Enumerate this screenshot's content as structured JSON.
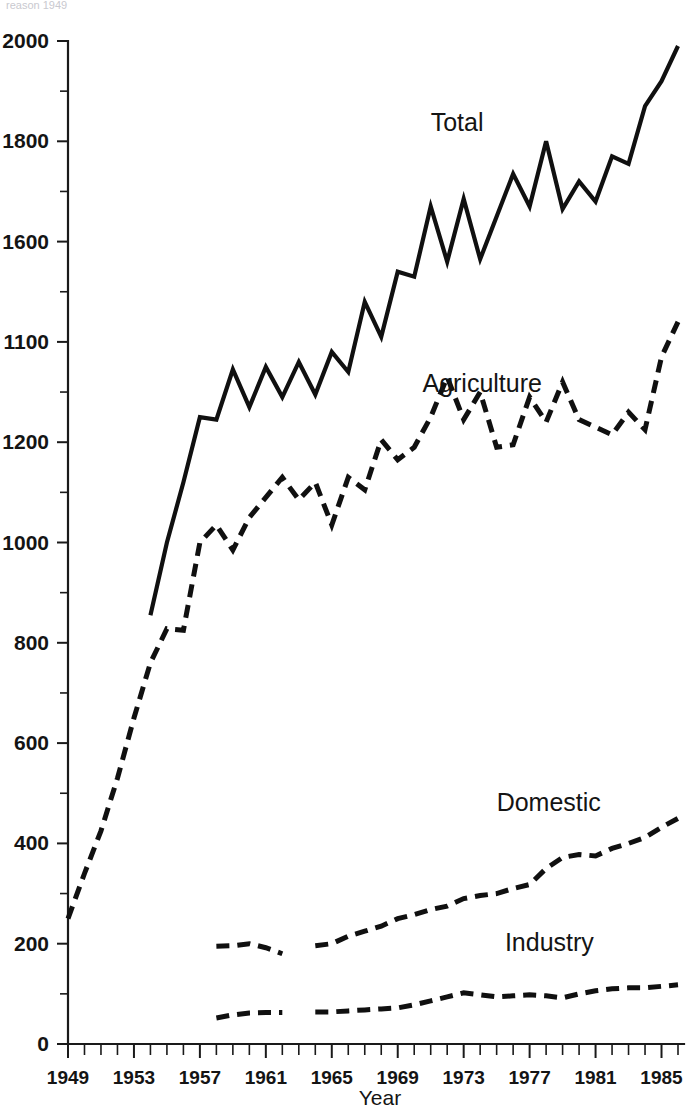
{
  "figure": {
    "top_fragment": "reason 1949",
    "background_color": "#ffffff",
    "ink_color": "#101010"
  },
  "labels": {
    "total": "Total",
    "agriculture": "Agriculture",
    "domestic": "Domestic",
    "industry": "Industry",
    "xaxis_title": "Year"
  },
  "chart_data": {
    "type": "line",
    "title": "",
    "subtitle": "",
    "xlabel": "Year",
    "ylabel": "",
    "xlim": [
      1949,
      1986
    ],
    "ylim": [
      0,
      2000
    ],
    "grid": false,
    "legend_position": "inline-annotations",
    "y_ticks_major": [
      0,
      200,
      400,
      600,
      800,
      1000,
      1200,
      1100,
      1600,
      1800,
      2000
    ],
    "y_tick_labels": [
      "0",
      "200",
      "400",
      "600",
      "800",
      "1000",
      "1200",
      "1100",
      "1600",
      "1800",
      "2000"
    ],
    "y_tick_values": [
      0,
      200,
      400,
      600,
      800,
      1000,
      1200,
      1400,
      1600,
      1800,
      2000
    ],
    "y_minor_tick_values": [
      100,
      300,
      500,
      700,
      900,
      1100,
      1300,
      1500,
      1700,
      1900
    ],
    "x_tick_labels": [
      "1949",
      "1953",
      "1957",
      "1961",
      "1965",
      "1969",
      "1973",
      "1977",
      "1981",
      "1985"
    ],
    "x_tick_values": [
      1949,
      1953,
      1957,
      1961,
      1965,
      1969,
      1973,
      1977,
      1981,
      1985
    ],
    "x_minor_tick_step": 1,
    "series": [
      {
        "name": "Total",
        "style": "solid",
        "x": [
          1954,
          1955,
          1956,
          1957,
          1958,
          1959,
          1960,
          1961,
          1962,
          1963,
          1964,
          1965,
          1966,
          1967,
          1968,
          1969,
          1970,
          1971,
          1972,
          1973,
          1974,
          1975,
          1976,
          1977,
          1978,
          1979,
          1980,
          1981,
          1982,
          1983,
          1984,
          1985,
          1986
        ],
        "values": [
          855,
          1000,
          1120,
          1250,
          1245,
          1345,
          1270,
          1350,
          1290,
          1360,
          1295,
          1380,
          1340,
          1480,
          1410,
          1540,
          1530,
          1670,
          1560,
          1685,
          1565,
          1650,
          1735,
          1670,
          1800,
          1665,
          1720,
          1680,
          1770,
          1755,
          1870,
          1920,
          1990
        ]
      },
      {
        "name": "Agriculture",
        "style": "dashed",
        "x": [
          1949,
          1950,
          1951,
          1952,
          1953,
          1954,
          1955,
          1956,
          1957,
          1958,
          1959,
          1960,
          1961,
          1962,
          1963,
          1964,
          1965,
          1966,
          1967,
          1968,
          1969,
          1970,
          1971,
          1972,
          1973,
          1974,
          1975,
          1976,
          1977,
          1978,
          1979,
          1980,
          1981,
          1982,
          1983,
          1984,
          1985,
          1986
        ],
        "values": [
          250,
          340,
          425,
          530,
          650,
          760,
          828,
          825,
          1000,
          1035,
          985,
          1050,
          1090,
          1130,
          1085,
          1120,
          1035,
          1130,
          1105,
          1205,
          1165,
          1190,
          1250,
          1330,
          1245,
          1300,
          1190,
          1195,
          1290,
          1240,
          1320,
          1245,
          1230,
          1215,
          1260,
          1225,
          1370,
          1440
        ]
      },
      {
        "name": "Domestic",
        "style": "dashed",
        "segments": [
          {
            "x": [
              1958,
              1959,
              1960,
              1961,
              1962
            ],
            "values": [
              195,
              196,
              200,
              192,
              180
            ]
          },
          {
            "x": [
              1964,
              1965,
              1966,
              1967,
              1968,
              1969,
              1970,
              1971,
              1972,
              1973,
              1974,
              1975,
              1976,
              1977,
              1978,
              1979,
              1980,
              1981,
              1982,
              1983,
              1984,
              1985,
              1986
            ],
            "values": [
              196,
              200,
              215,
              225,
              235,
              250,
              258,
              268,
              275,
              290,
              296,
              300,
              310,
              318,
              350,
              372,
              378,
              375,
              390,
              400,
              412,
              432,
              450
            ]
          }
        ]
      },
      {
        "name": "Industry",
        "style": "dashed",
        "segments": [
          {
            "x": [
              1958,
              1959,
              1960,
              1961,
              1962
            ],
            "values": [
              52,
              58,
              62,
              63,
              63
            ]
          },
          {
            "x": [
              1964,
              1965,
              1966,
              1967,
              1968,
              1969,
              1970,
              1971,
              1972,
              1973,
              1974,
              1975,
              1976,
              1977,
              1978,
              1979,
              1980,
              1981,
              1982,
              1983,
              1984,
              1985,
              1986
            ],
            "values": [
              64,
              64,
              66,
              68,
              70,
              72,
              78,
              86,
              94,
              102,
              98,
              94,
              96,
              98,
              96,
              92,
              100,
              106,
              110,
              112,
              112,
              115,
              118
            ]
          }
        ]
      }
    ],
    "annotations": [
      {
        "text": "Total",
        "x": 1971.0,
        "y": 1820
      },
      {
        "text": "Agriculture",
        "x": 1970.5,
        "y": 1300
      },
      {
        "text": "Domestic",
        "x": 1975.0,
        "y": 465
      },
      {
        "text": "Industry",
        "x": 1975.5,
        "y": 185
      }
    ]
  }
}
